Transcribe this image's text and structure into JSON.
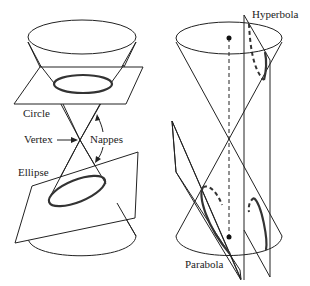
{
  "figure": {
    "left_panel": {
      "labels": {
        "circle": "Circle",
        "vertex": "Vertex",
        "nappes": "Nappes",
        "ellipse": "Ellipse"
      }
    },
    "right_panel": {
      "labels": {
        "hyperbola": "Hyperbola",
        "parabola": "Parabola"
      }
    },
    "colors": {
      "stroke": "#222222",
      "background": "#ffffff"
    }
  }
}
